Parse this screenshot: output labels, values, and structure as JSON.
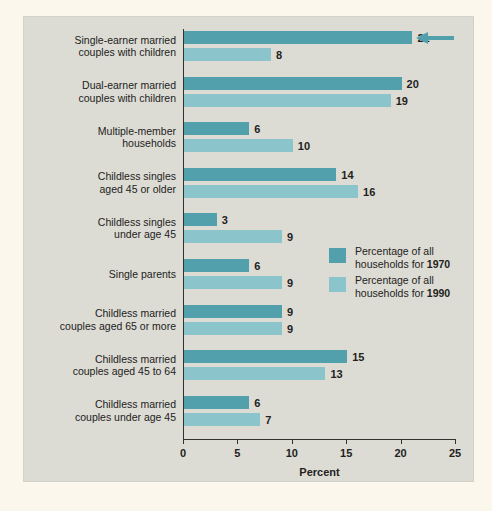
{
  "chart_data": {
    "type": "bar",
    "orientation": "horizontal",
    "title": "",
    "xlabel": "Percent",
    "ylabel": "",
    "xlim": [
      0,
      25
    ],
    "xticks": [
      0,
      5,
      10,
      15,
      20,
      25
    ],
    "grid": false,
    "legend_position": "inside-right",
    "categories": [
      "Single-earner married couples with children",
      "Dual-earner married couples with children",
      "Multiple-member households",
      "Childless singles aged 45 or older",
      "Childless singles under age 45",
      "Single parents",
      "Childless married couples aged 65 or more",
      "Childless married couples aged 45 to 64",
      "Childless married couples under age 45"
    ],
    "category_lines": [
      [
        "Single-earner married",
        "couples with children"
      ],
      [
        "Dual-earner married",
        "couples with children"
      ],
      [
        "Multiple-member",
        "households"
      ],
      [
        "Childless singles",
        "aged 45 or older"
      ],
      [
        "Childless singles",
        "under age 45"
      ],
      [
        "Single parents"
      ],
      [
        "Childless married",
        "couples aged 65 or more"
      ],
      [
        "Childless married",
        "couples aged 45 to 64"
      ],
      [
        "Childless married",
        "couples under age 45"
      ]
    ],
    "series": [
      {
        "name": "Percentage of all households for 1970",
        "year": "1970",
        "color": "#51a0ac",
        "values": [
          21,
          20,
          6,
          14,
          3,
          6,
          9,
          15,
          6
        ]
      },
      {
        "name": "Percentage of all households for 1990",
        "year": "1990",
        "color": "#8cc4cc",
        "values": [
          8,
          19,
          10,
          16,
          9,
          9,
          9,
          13,
          7
        ]
      }
    ],
    "annotations": [
      {
        "name": "highlight-arrow",
        "icon": "arrow-left-icon",
        "points_at_category": "Single-earner married couples with children",
        "points_at_series": "1970",
        "points_at_value": 21,
        "color": "#51a0ac"
      }
    ]
  },
  "axis": {
    "xlabel": "Percent",
    "tick_labels": [
      "0",
      "5",
      "10",
      "15",
      "20",
      "25"
    ]
  },
  "legend": {
    "items": [
      {
        "line1": "Percentage of all",
        "line2_prefix": "households for ",
        "line2_bold": "1970",
        "color": "#51a0ac"
      },
      {
        "line1": "Percentage of all",
        "line2_prefix": "households for ",
        "line2_bold": "1990",
        "color": "#8cc4cc"
      }
    ]
  },
  "colors": {
    "page_background": "#fcf7ed",
    "panel_background": "#dcdcd5",
    "series_1970": "#51a0ac",
    "series_1990": "#8cc4cc",
    "axis": "#33312c",
    "text": "#232220"
  }
}
